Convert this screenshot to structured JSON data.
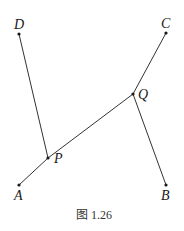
{
  "figure": {
    "caption": "图 1.26",
    "colors": {
      "line": "#333333",
      "text": "#1a1a1a",
      "background": "#ffffff"
    },
    "points": {
      "A": {
        "label": "A",
        "x": 19,
        "y": 185
      },
      "B": {
        "label": "B",
        "x": 166,
        "y": 185
      },
      "C": {
        "label": "C",
        "x": 166,
        "y": 33
      },
      "D": {
        "label": "D",
        "x": 19,
        "y": 34
      },
      "P": {
        "label": "P",
        "x": 48,
        "y": 158
      },
      "Q": {
        "label": "Q",
        "x": 133,
        "y": 94
      }
    },
    "segments": [
      {
        "from": "A",
        "to": "P"
      },
      {
        "from": "P",
        "to": "Q"
      },
      {
        "from": "Q",
        "to": "C"
      },
      {
        "from": "D",
        "to": "P"
      },
      {
        "from": "Q",
        "to": "B"
      }
    ]
  }
}
